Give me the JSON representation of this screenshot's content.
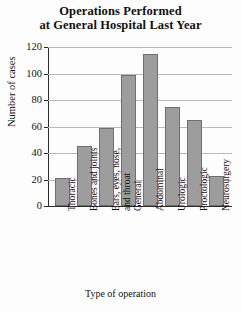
{
  "chart_data": {
    "type": "bar",
    "title": "Operations Performed at General Hospital Last Year",
    "title_lines": [
      "Operations Performed",
      "at General Hospital Last Year"
    ],
    "xlabel": "Type of operation",
    "ylabel": "Number of cases",
    "ylim": [
      0,
      120
    ],
    "ytick_step": 20,
    "yticks": [
      120,
      100,
      80,
      60,
      40,
      20,
      0
    ],
    "ytick_labels": [
      "120",
      "100",
      "80",
      "60",
      "40",
      "20",
      "0"
    ],
    "grid": true,
    "legend": null,
    "categories": [
      "Thoracic",
      "Bones and joints",
      "Ears, eyes, nose, and throat",
      "General",
      "Abdominal",
      "Urologic",
      "Proctologic",
      "Neurosurgery"
    ],
    "category_label_lines": [
      [
        "Thoracic"
      ],
      [
        "Bones and joints"
      ],
      [
        "Ears, eyes, nose,",
        "and throat"
      ],
      [
        "General"
      ],
      [
        "Abdominal"
      ],
      [
        "Urologic"
      ],
      [
        "Proctologic"
      ],
      [
        "Neurosurgery"
      ]
    ],
    "values": [
      21,
      45,
      59,
      99,
      115,
      75,
      65,
      23
    ],
    "bar_color": "#9d9d9d",
    "bar_edge_color": "#6f6f6f",
    "grid_color": "#b9b9b9",
    "axis_color": "#2b2b2b",
    "background_color": "#fdfdfd"
  }
}
